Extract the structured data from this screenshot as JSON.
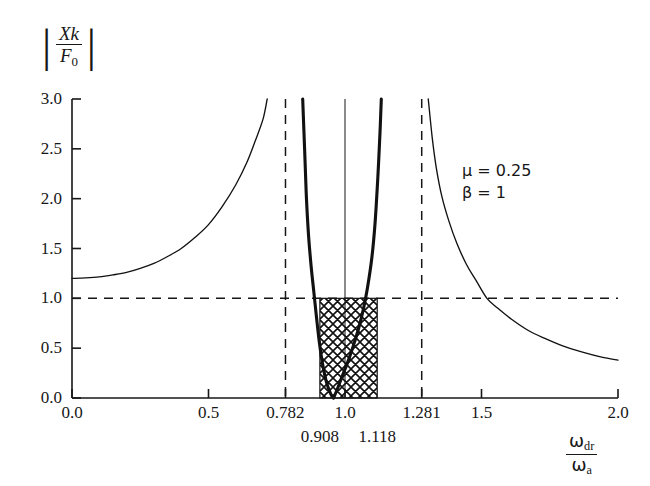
{
  "chart_data": {
    "type": "line",
    "title": "",
    "subtitle": "",
    "xlabel_num": "ω",
    "xlabel_num_sub": "dr",
    "xlabel_den": "ω",
    "xlabel_den_sub": "a",
    "ylabel_num": "Xk",
    "ylabel_den": "F",
    "ylabel_den_sub": "0",
    "ylabel_abs_bars": "|",
    "xlim": [
      0.0,
      2.0
    ],
    "ylim": [
      0.0,
      3.0
    ],
    "grid": false,
    "legend_position": "none",
    "xticks": [
      0.0,
      0.5,
      0.782,
      1.0,
      1.281,
      1.5,
      2.0
    ],
    "xtick_labels": [
      "0.0",
      "0.5",
      "0.782",
      "1.0",
      "1.281",
      "1.5",
      "2.0"
    ],
    "xticks_lower_row": [
      0.908,
      1.118
    ],
    "xtick_labels_lower_row": [
      "0.908",
      "1.118"
    ],
    "yticks": [
      0.0,
      0.5,
      1.0,
      1.5,
      2.0,
      2.5,
      3.0
    ],
    "ytick_labels": [
      "0.0",
      "0.5",
      "1.0",
      "1.5",
      "2.0",
      "2.5",
      "3.0"
    ],
    "annotations": [
      {
        "text": "μ = 0.25",
        "x": 1.55,
        "y": 2.15
      },
      {
        "text": "β = 1",
        "x": 1.55,
        "y": 1.95
      }
    ],
    "parameters": {
      "mu": 0.25,
      "beta": 1
    },
    "reference_lines": [
      {
        "orientation": "vertical",
        "value": 0.782,
        "style": "dashed",
        "label": "0.782"
      },
      {
        "orientation": "vertical",
        "value": 1.0,
        "style": "solid",
        "label": "1.0"
      },
      {
        "orientation": "vertical",
        "value": 1.281,
        "style": "dashed",
        "label": "1.281"
      },
      {
        "orientation": "horizontal",
        "value": 1.0,
        "style": "dashed",
        "label": "1.0"
      }
    ],
    "shaded_region": {
      "hatch": "crosshatch",
      "x_from": 0.908,
      "x_to": 1.118,
      "y_from": 0.0,
      "y_to": 1.0
    },
    "series": [
      {
        "name": "left-branch",
        "style": "thin-solid",
        "points": [
          [
            0.0,
            1.2
          ],
          [
            0.05,
            1.205
          ],
          [
            0.1,
            1.215
          ],
          [
            0.15,
            1.235
          ],
          [
            0.2,
            1.26
          ],
          [
            0.25,
            1.3
          ],
          [
            0.3,
            1.35
          ],
          [
            0.35,
            1.42
          ],
          [
            0.4,
            1.5
          ],
          [
            0.45,
            1.61
          ],
          [
            0.5,
            1.74
          ],
          [
            0.55,
            1.92
          ],
          [
            0.6,
            2.14
          ],
          [
            0.64,
            2.36
          ],
          [
            0.67,
            2.57
          ],
          [
            0.7,
            2.8
          ],
          [
            0.715,
            3.0
          ]
        ]
      },
      {
        "name": "inner-left-branch",
        "style": "thick-solid",
        "points": [
          [
            0.845,
            3.0
          ],
          [
            0.852,
            2.5
          ],
          [
            0.858,
            2.05
          ],
          [
            0.866,
            1.65
          ],
          [
            0.876,
            1.32
          ],
          [
            0.886,
            1.06
          ],
          [
            0.896,
            0.8
          ],
          [
            0.906,
            0.56
          ],
          [
            0.918,
            0.34
          ],
          [
            0.932,
            0.16
          ],
          [
            0.948,
            0.04
          ],
          [
            0.958,
            0.0
          ]
        ]
      },
      {
        "name": "inner-right-branch",
        "style": "thick-solid",
        "points": [
          [
            0.958,
            0.0
          ],
          [
            0.972,
            0.09
          ],
          [
            0.99,
            0.22
          ],
          [
            1.01,
            0.36
          ],
          [
            1.03,
            0.52
          ],
          [
            1.05,
            0.7
          ],
          [
            1.068,
            0.9
          ],
          [
            1.082,
            1.1
          ],
          [
            1.098,
            1.4
          ],
          [
            1.11,
            1.75
          ],
          [
            1.12,
            2.2
          ],
          [
            1.128,
            2.65
          ],
          [
            1.133,
            3.0
          ]
        ]
      },
      {
        "name": "right-branch",
        "style": "thin-solid",
        "points": [
          [
            1.305,
            3.0
          ],
          [
            1.32,
            2.6
          ],
          [
            1.335,
            2.3
          ],
          [
            1.355,
            2.02
          ],
          [
            1.38,
            1.78
          ],
          [
            1.41,
            1.55
          ],
          [
            1.445,
            1.34
          ],
          [
            1.48,
            1.18
          ],
          [
            1.52,
            1.0
          ],
          [
            1.56,
            0.9
          ],
          [
            1.61,
            0.79
          ],
          [
            1.67,
            0.68
          ],
          [
            1.73,
            0.6
          ],
          [
            1.8,
            0.52
          ],
          [
            1.87,
            0.46
          ],
          [
            1.94,
            0.41
          ],
          [
            2.0,
            0.38
          ]
        ]
      }
    ]
  }
}
